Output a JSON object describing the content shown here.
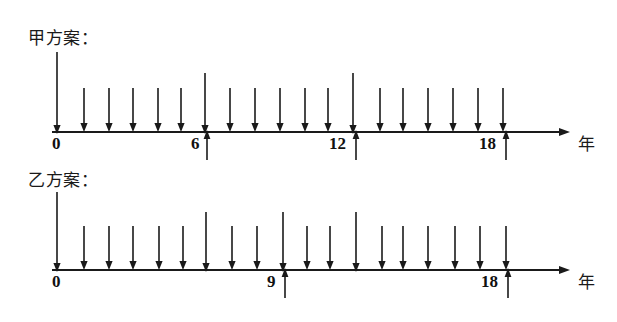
{
  "figure": {
    "kind": "cash-flow-timeline-diagram",
    "background_color": "#ffffff",
    "stroke_color": "#1a1a1a",
    "axis_unit_label": "年"
  },
  "timelines": [
    {
      "id": "plan-jia",
      "caption": "甲方案：",
      "caption_x": 28,
      "caption_y": 24,
      "axis": {
        "y": 132,
        "x_start": 52,
        "x_end": 570,
        "arrowhead": true
      },
      "unit_label": "年",
      "unit_label_x": 578,
      "unit_label_y": 130,
      "tick_labels": [
        {
          "text": "0",
          "x": 57,
          "y": 137
        },
        {
          "text": "6",
          "x": 197,
          "y": 137
        },
        {
          "text": "12",
          "x": 340,
          "y": 137
        },
        {
          "text": "18",
          "x": 490,
          "y": 137
        }
      ],
      "down_arrows": [
        {
          "x": 57,
          "top": 52,
          "long": true
        },
        {
          "x": 84,
          "top": 88,
          "long": false
        },
        {
          "x": 109,
          "top": 88,
          "long": false
        },
        {
          "x": 133,
          "top": 88,
          "long": false
        },
        {
          "x": 158,
          "top": 88,
          "long": false
        },
        {
          "x": 181,
          "top": 88,
          "long": false
        },
        {
          "x": 205,
          "top": 73,
          "long": true
        },
        {
          "x": 230,
          "top": 88,
          "long": false
        },
        {
          "x": 255,
          "top": 88,
          "long": false
        },
        {
          "x": 280,
          "top": 88,
          "long": false
        },
        {
          "x": 305,
          "top": 88,
          "long": false
        },
        {
          "x": 328,
          "top": 88,
          "long": false
        },
        {
          "x": 353,
          "top": 73,
          "long": true
        },
        {
          "x": 380,
          "top": 88,
          "long": false
        },
        {
          "x": 403,
          "top": 88,
          "long": false
        },
        {
          "x": 428,
          "top": 88,
          "long": false
        },
        {
          "x": 453,
          "top": 88,
          "long": false
        },
        {
          "x": 478,
          "top": 88,
          "long": false
        },
        {
          "x": 503,
          "top": 88,
          "long": false
        }
      ],
      "up_arrows": [
        {
          "x": 207,
          "bottom": 160
        },
        {
          "x": 356,
          "bottom": 160
        },
        {
          "x": 506,
          "bottom": 160
        }
      ]
    },
    {
      "id": "plan-yi",
      "caption": "乙方案：",
      "caption_x": 28,
      "caption_y": 166,
      "axis": {
        "y": 270,
        "x_start": 52,
        "x_end": 570,
        "arrowhead": true
      },
      "unit_label": "年",
      "unit_label_x": 578,
      "unit_label_y": 268,
      "tick_labels": [
        {
          "text": "0",
          "x": 57,
          "y": 275
        },
        {
          "text": "9",
          "x": 272,
          "y": 275
        },
        {
          "text": "18",
          "x": 492,
          "y": 275
        }
      ],
      "down_arrows": [
        {
          "x": 57,
          "top": 192,
          "long": true
        },
        {
          "x": 84,
          "top": 226,
          "long": false
        },
        {
          "x": 109,
          "top": 226,
          "long": false
        },
        {
          "x": 133,
          "top": 226,
          "long": false
        },
        {
          "x": 159,
          "top": 226,
          "long": false
        },
        {
          "x": 183,
          "top": 226,
          "long": false
        },
        {
          "x": 206,
          "top": 212,
          "long": true
        },
        {
          "x": 232,
          "top": 226,
          "long": false
        },
        {
          "x": 257,
          "top": 226,
          "long": false
        },
        {
          "x": 283,
          "top": 212,
          "long": true
        },
        {
          "x": 307,
          "top": 226,
          "long": false
        },
        {
          "x": 330,
          "top": 226,
          "long": false
        },
        {
          "x": 356,
          "top": 212,
          "long": true
        },
        {
          "x": 382,
          "top": 226,
          "long": false
        },
        {
          "x": 403,
          "top": 226,
          "long": false
        },
        {
          "x": 428,
          "top": 226,
          "long": false
        },
        {
          "x": 455,
          "top": 226,
          "long": false
        },
        {
          "x": 480,
          "top": 226,
          "long": false
        },
        {
          "x": 506,
          "top": 226,
          "long": false
        }
      ],
      "up_arrows": [
        {
          "x": 285,
          "bottom": 298
        },
        {
          "x": 508,
          "bottom": 298
        }
      ]
    }
  ]
}
